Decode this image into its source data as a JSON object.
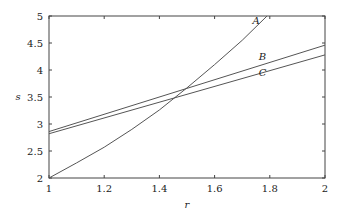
{
  "chart_data": {
    "type": "line",
    "title": "",
    "xlabel": "r",
    "ylabel": "s",
    "xlim": [
      1,
      2
    ],
    "ylim": [
      2,
      5
    ],
    "xticks": [
      "1",
      "1.2",
      "1.4",
      "1.6",
      "1.8",
      "2"
    ],
    "yticks": [
      "2",
      "2.5",
      "3",
      "3.5",
      "4",
      "4.5",
      "5"
    ],
    "grid": false,
    "series": [
      {
        "name": "A",
        "x": [
          1,
          1.1,
          1.2,
          1.3,
          1.4,
          1.5,
          1.6,
          1.7,
          1.79
        ],
        "y": [
          2,
          2.28,
          2.57,
          2.9,
          3.26,
          3.67,
          4.1,
          4.55,
          5.0
        ]
      },
      {
        "name": "B",
        "x": [
          1,
          2
        ],
        "y": [
          2.86,
          4.46
        ]
      },
      {
        "name": "C",
        "x": [
          1,
          2
        ],
        "y": [
          2.82,
          4.28
        ]
      }
    ]
  }
}
